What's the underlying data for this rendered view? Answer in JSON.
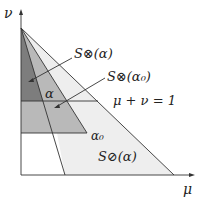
{
  "diagram": {
    "axes": {
      "x_label": "μ",
      "y_label": "ν"
    },
    "labels": {
      "s_otimes_alpha": "S⊗(α)",
      "s_otimes_alpha0": "S⊗(α₀)",
      "line_eq": "μ + ν = 1",
      "alpha": "α",
      "alpha0": "α₀",
      "s_oslash_alpha": "S⊘(α)"
    },
    "colors": {
      "dark_region": "#7a7a7a",
      "mid_region": "#b4b4b4",
      "light_region": "#ededed",
      "lines": "#333333"
    }
  }
}
